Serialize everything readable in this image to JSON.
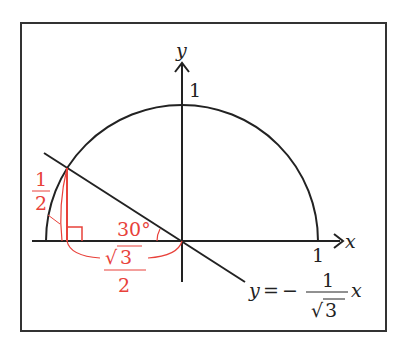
{
  "diagram": {
    "axes": {
      "x_label": "x",
      "y_label": "y",
      "x_tick": "1",
      "y_tick": "1"
    },
    "line_equation": {
      "lhs": "y",
      "eq": "=",
      "sign": "−",
      "numerator": "1",
      "denominator_root": "√",
      "denominator_value": "3",
      "var": "x"
    },
    "annotations": {
      "vertical_length": {
        "numerator": "1",
        "denominator": "2"
      },
      "horizontal_length": {
        "root": "√",
        "value": "3",
        "denominator": "2"
      },
      "angle": "30°"
    },
    "colors": {
      "stroke": "#222222",
      "highlight": "#e8413a",
      "frame": "#333333"
    }
  }
}
